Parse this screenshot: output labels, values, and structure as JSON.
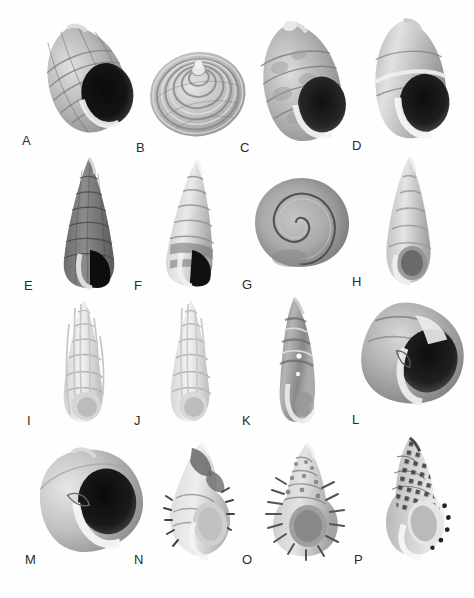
{
  "figure": {
    "kind": "specimen-plate",
    "background_color": "#ffffff",
    "label_color": "#2b2b2b",
    "rows": 4,
    "columns": 4,
    "total_panels": 16,
    "panels": [
      {
        "label": "A",
        "shape": "ovate-conic",
        "aperture": "large-dark",
        "tone": "banded-dark",
        "orientation": "tilted-left",
        "x": 22,
        "y": 134,
        "cx": 88,
        "cy": 78,
        "w": 120,
        "h": 120
      },
      {
        "label": "B",
        "shape": "globose-turbinate",
        "aperture": "hidden",
        "tone": "ribbed-mid",
        "orientation": "apical",
        "x": 136,
        "y": 141,
        "cx": 198,
        "cy": 85,
        "w": 112,
        "h": 112
      },
      {
        "label": "C",
        "shape": "ovate-conic",
        "aperture": "large-dark",
        "tone": "mottled-mid",
        "orientation": "tilted-left",
        "x": 240,
        "y": 141,
        "cx": 305,
        "cy": 82,
        "w": 118,
        "h": 126
      },
      {
        "label": "D",
        "shape": "ovate-conic",
        "aperture": "large-dark",
        "tone": "smooth-light",
        "orientation": "upright",
        "x": 352,
        "y": 139,
        "cx": 412,
        "cy": 80,
        "w": 112,
        "h": 128
      },
      {
        "label": "E",
        "shape": "high-spired",
        "aperture": "small-dark",
        "tone": "granulate-dark",
        "orientation": "upright",
        "x": 24,
        "y": 279,
        "cx": 89,
        "cy": 222,
        "w": 74,
        "h": 136
      },
      {
        "label": "F",
        "shape": "high-spired",
        "aperture": "small-dark",
        "tone": "banded-light",
        "orientation": "upright",
        "x": 134,
        "y": 279,
        "cx": 190,
        "cy": 220,
        "w": 70,
        "h": 132
      },
      {
        "label": "G",
        "shape": "planispiral",
        "aperture": "lateral",
        "tone": "smooth-mid",
        "orientation": "apical-flat",
        "x": 242,
        "y": 278,
        "cx": 300,
        "cy": 222,
        "w": 100,
        "h": 92
      },
      {
        "label": "H",
        "shape": "conic-elongate",
        "aperture": "oval-dark",
        "tone": "smooth-pale",
        "orientation": "upright",
        "x": 352,
        "y": 275,
        "cx": 409,
        "cy": 222,
        "w": 68,
        "h": 134
      },
      {
        "label": "I",
        "shape": "turreted-ribbed",
        "aperture": "small-pale",
        "tone": "white-ribbed",
        "orientation": "upright",
        "x": 25,
        "y": 414,
        "cx": 84,
        "cy": 360,
        "w": 62,
        "h": 132
      },
      {
        "label": "J",
        "shape": "turreted-ribbed",
        "aperture": "small-pale",
        "tone": "white-ribbed",
        "orientation": "upright",
        "x": 134,
        "y": 414,
        "cx": 191,
        "cy": 360,
        "w": 60,
        "h": 132
      },
      {
        "label": "K",
        "shape": "fusiform-curved",
        "aperture": "narrow",
        "tone": "banded-dark",
        "orientation": "curved-left",
        "x": 242,
        "y": 414,
        "cx": 297,
        "cy": 360,
        "w": 56,
        "h": 128
      },
      {
        "label": "L",
        "shape": "globose-broad",
        "aperture": "large-dark",
        "tone": "smooth-mid",
        "orientation": "tilted-right",
        "x": 352,
        "y": 413,
        "cx": 410,
        "cy": 355,
        "w": 116,
        "h": 108
      },
      {
        "label": "M",
        "shape": "globose-broad",
        "aperture": "large-dark",
        "tone": "smooth-light",
        "orientation": "tilted-left",
        "x": 25,
        "y": 553,
        "cx": 92,
        "cy": 500,
        "w": 124,
        "h": 112
      },
      {
        "label": "N",
        "shape": "spinose-fusiform",
        "aperture": "oval-pale",
        "tone": "spiny-mid",
        "orientation": "upright",
        "x": 134,
        "y": 553,
        "cx": 196,
        "cy": 498,
        "w": 84,
        "h": 122
      },
      {
        "label": "O",
        "shape": "spinose-turbinate",
        "aperture": "round-dark",
        "tone": "spiny-mid",
        "orientation": "upright",
        "x": 242,
        "y": 553,
        "cx": 303,
        "cy": 500,
        "w": 100,
        "h": 122
      },
      {
        "label": "P",
        "shape": "ovate-fusiform",
        "aperture": "oval-pale",
        "tone": "checkered-dark",
        "orientation": "upright",
        "x": 354,
        "y": 553,
        "cx": 411,
        "cy": 497,
        "w": 88,
        "h": 126
      }
    ]
  }
}
